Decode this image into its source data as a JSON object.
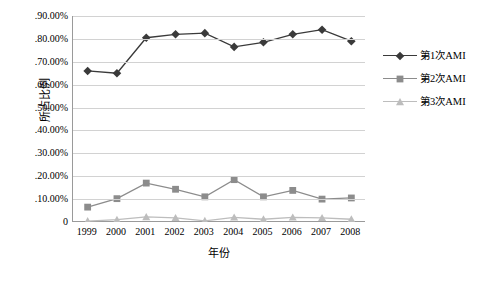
{
  "chart_data": {
    "type": "line",
    "title": "",
    "xlabel": "年份",
    "ylabel": "所占比例",
    "categories": [
      "1999",
      "2000",
      "2001",
      "2002",
      "2003",
      "2004",
      "2005",
      "2006",
      "2007",
      "2008"
    ],
    "ylim": [
      0,
      0.9
    ],
    "ytick_labels": [
      "0",
      ".10.00%",
      ".20.00%",
      ".30.00%",
      ".40.00%",
      ".50.00%",
      ".60.00%",
      ".70.00%",
      ".80.00%",
      ".90.00%"
    ],
    "ytick_values": [
      0,
      0.1,
      0.2,
      0.3,
      0.4,
      0.5,
      0.6,
      0.7,
      0.8,
      0.9
    ],
    "grid": "horizontal",
    "legend_position": "right",
    "series": [
      {
        "name": "第1次AMI",
        "color": "#3a3a3a",
        "marker": "diamond",
        "values": [
          0.66,
          0.65,
          0.805,
          0.82,
          0.825,
          0.765,
          0.785,
          0.82,
          0.84,
          0.79
        ]
      },
      {
        "name": "第2次AMI",
        "color": "#8c8c8c",
        "marker": "square",
        "values": [
          0.065,
          0.102,
          0.17,
          0.143,
          0.11,
          0.185,
          0.11,
          0.138,
          0.1,
          0.105
        ]
      },
      {
        "name": "第3次AMI",
        "color": "#bdbdbd",
        "marker": "triangle",
        "values": [
          0.004,
          0.01,
          0.022,
          0.018,
          0.005,
          0.02,
          0.012,
          0.02,
          0.018,
          0.012
        ]
      }
    ]
  },
  "ytick_text": [
    "0",
    ".10.00%",
    ".20.00%",
    ".30.00%",
    ".40.00%",
    ".50.00%",
    ".60.00%",
    ".70.00%",
    ".80.00%",
    ".90.00%"
  ]
}
